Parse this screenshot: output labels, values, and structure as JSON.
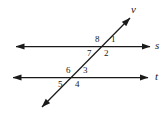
{
  "figure": {
    "background_color": "#ffffff",
    "stroke_color": "#1a1a1a",
    "label_color": "#1a1a1a"
  },
  "lines": [
    {
      "id": "line-s",
      "name": "s",
      "label": "s",
      "type": "horizontal",
      "arrows": "both",
      "label_x": 155,
      "label_y": 40
    },
    {
      "id": "line-t",
      "name": "t",
      "label": "t",
      "type": "horizontal",
      "arrows": "both",
      "label_x": 155,
      "label_y": 71
    },
    {
      "id": "line-v",
      "name": "v",
      "label": "v",
      "type": "transversal",
      "arrows": "both",
      "label_x": 131,
      "label_y": 4
    }
  ],
  "angles": [
    {
      "label": "1",
      "x": 111,
      "y": 35,
      "position": "upper-right-of-s-intersection"
    },
    {
      "label": "2",
      "x": 104,
      "y": 49,
      "position": "lower-right-of-s-intersection"
    },
    {
      "label": "3",
      "x": 83,
      "y": 66,
      "position": "upper-right-of-t-intersection"
    },
    {
      "label": "4",
      "x": 75,
      "y": 80,
      "position": "lower-right-of-t-intersection"
    },
    {
      "label": "5",
      "x": 58,
      "y": 80,
      "position": "lower-left-of-t-intersection"
    },
    {
      "label": "6",
      "x": 66,
      "y": 66,
      "position": "upper-left-of-t-intersection"
    },
    {
      "label": "7",
      "x": 87,
      "y": 49,
      "position": "lower-left-of-s-intersection"
    },
    {
      "label": "8",
      "x": 95,
      "y": 35,
      "position": "upper-left-of-s-intersection"
    }
  ],
  "geometry": {
    "line_s": {
      "x1": 16,
      "y1": 46.5,
      "x2": 150,
      "y2": 46.5
    },
    "line_t": {
      "x1": 13,
      "y1": 77.5,
      "x2": 148,
      "y2": 77.5
    },
    "line_v": {
      "x1": 42,
      "y1": 107,
      "x2": 130,
      "y2": 18
    }
  }
}
